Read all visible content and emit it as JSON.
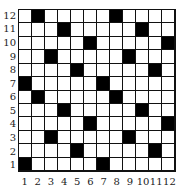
{
  "grid": {
    "rows": 12,
    "cols": 12,
    "row_labels": [
      "12",
      "11",
      "10",
      "9",
      "8",
      "7",
      "6",
      "5",
      "4",
      "3",
      "2",
      "1"
    ],
    "col_labels": [
      "1",
      "2",
      "3",
      "4",
      "5",
      "6",
      "7",
      "8",
      "9",
      "10",
      "11",
      "12"
    ],
    "fill_color": "#000000",
    "empty_color": "#ffffff",
    "black_cells": [
      {
        "row": 12,
        "cols": [
          2,
          8
        ]
      },
      {
        "row": 11,
        "cols": [
          4,
          10
        ]
      },
      {
        "row": 10,
        "cols": [
          6,
          12
        ]
      },
      {
        "row": 9,
        "cols": [
          3,
          9
        ]
      },
      {
        "row": 8,
        "cols": [
          5,
          11
        ]
      },
      {
        "row": 7,
        "cols": [
          1,
          7
        ]
      },
      {
        "row": 6,
        "cols": [
          2,
          8
        ]
      },
      {
        "row": 5,
        "cols": [
          4,
          10
        ]
      },
      {
        "row": 4,
        "cols": [
          6,
          12
        ]
      },
      {
        "row": 3,
        "cols": [
          3,
          9
        ]
      },
      {
        "row": 2,
        "cols": [
          5,
          11
        ]
      },
      {
        "row": 1,
        "cols": [
          1,
          7
        ]
      }
    ]
  }
}
